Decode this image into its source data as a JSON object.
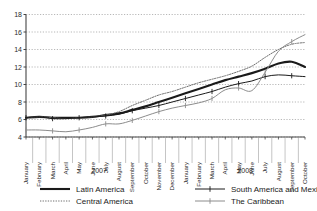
{
  "chart_data": {
    "type": "line",
    "title": "",
    "xlabel": "",
    "ylabel": "",
    "ylim": [
      4,
      18
    ],
    "yticks": [
      4,
      6,
      8,
      10,
      12,
      14,
      16,
      18
    ],
    "grid": true,
    "legend_position": "bottom",
    "year_groups": [
      {
        "label": "2007",
        "start_index": 0,
        "end_index": 11
      },
      {
        "label": "2008",
        "start_index": 12,
        "end_index": 21
      }
    ],
    "categories": [
      "January",
      "February",
      "March",
      "April",
      "May",
      "June",
      "July",
      "August",
      "September",
      "October",
      "November",
      "December",
      "January",
      "February",
      "March",
      "April",
      "May",
      "June",
      "July",
      "August",
      "September",
      "October"
    ],
    "series": [
      {
        "name": "Latin America",
        "color": "#1a1a1a",
        "style": "solid-thick",
        "marker": "none",
        "values": [
          6.2,
          6.3,
          6.2,
          6.2,
          6.2,
          6.3,
          6.5,
          6.7,
          7.1,
          7.5,
          8.0,
          8.5,
          9.0,
          9.5,
          10.0,
          10.5,
          10.9,
          11.3,
          11.8,
          12.4,
          12.6,
          12.0
        ]
      },
      {
        "name": "Central America",
        "color": "#6e6e6e",
        "style": "dotted",
        "marker": "none",
        "values": [
          6.2,
          6.3,
          6.2,
          6.1,
          6.2,
          6.3,
          6.5,
          6.9,
          7.6,
          8.2,
          8.8,
          9.2,
          9.7,
          10.2,
          10.6,
          11.0,
          11.5,
          12.1,
          13.1,
          14.0,
          14.6,
          14.8
        ]
      },
      {
        "name": "South America and Mexico",
        "color": "#1a1a1a",
        "style": "solid-thin",
        "marker": "plus",
        "values": [
          6.2,
          6.3,
          6.1,
          6.1,
          6.2,
          6.3,
          6.4,
          6.6,
          7.0,
          7.3,
          7.6,
          8.0,
          8.4,
          8.8,
          9.2,
          9.7,
          10.1,
          10.4,
          10.9,
          11.1,
          11.0,
          10.9
        ]
      },
      {
        "name": "The Caribbean",
        "color": "#8c8c8c",
        "style": "solid-thin",
        "marker": "plus",
        "values": [
          4.8,
          4.8,
          4.7,
          4.6,
          4.8,
          5.1,
          5.5,
          5.5,
          5.9,
          6.4,
          6.9,
          7.3,
          7.6,
          7.9,
          8.4,
          9.4,
          9.6,
          9.3,
          11.4,
          13.8,
          14.9,
          15.7
        ]
      }
    ]
  },
  "legend": {
    "items": [
      {
        "label": "Latin America",
        "series_index": 0
      },
      {
        "label": "South America and Mexico",
        "series_index": 2
      },
      {
        "label": "Central America",
        "series_index": 1
      },
      {
        "label": "The Caribbean",
        "series_index": 3
      }
    ]
  }
}
